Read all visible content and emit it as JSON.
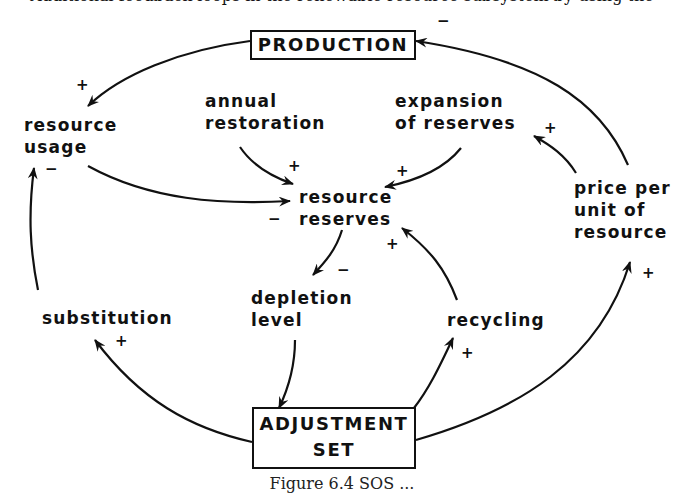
{
  "top_partial_text": "Additional feedback loops in the renewable resource subsystem by using the",
  "boxes": {
    "production": "PRODUCTION",
    "adjustment_line1": "ADJUSTMENT",
    "adjustment_line2": "SET"
  },
  "nodes": {
    "resource_usage": [
      "resource",
      "usage"
    ],
    "annual_restoration": [
      "annual",
      "restoration"
    ],
    "expansion_of_reserves": [
      "expansion",
      "of reserves"
    ],
    "resource_reserves": [
      "resource",
      "reserves"
    ],
    "price_per_unit": [
      "price per",
      "unit of",
      "resource"
    ],
    "substitution": [
      "substitution"
    ],
    "depletion_level": [
      "depletion",
      "level"
    ],
    "recycling": [
      "recycling"
    ]
  },
  "signs": {
    "production_to_usage": "+",
    "price_to_production": "−",
    "restoration_to_reserves": "+",
    "expansion_to_reserves": "+",
    "price_to_expansion": "+",
    "usage_to_reserves": "−",
    "substitution_to_usage": "−",
    "reserves_to_depletion": "−",
    "recycling_to_reserves": "+",
    "adjustment_to_substitution": "+",
    "adjustment_to_recycling": "+",
    "adjustment_to_price": "+"
  },
  "caption": "Figure 6.4  SOS ..."
}
